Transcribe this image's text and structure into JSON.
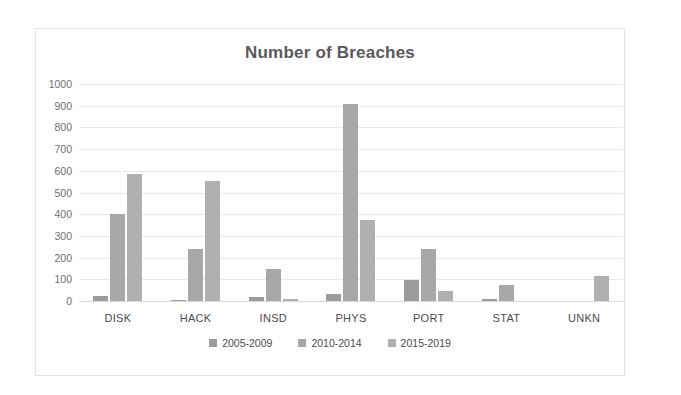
{
  "chart_data": {
    "type": "bar",
    "title": "Number of Breaches",
    "xlabel": "",
    "ylabel": "",
    "ylim": [
      0,
      1000
    ],
    "ytick_step": 100,
    "yticks": [
      "1000",
      "900",
      "800",
      "700",
      "600",
      "500",
      "400",
      "300",
      "200",
      "100",
      "0"
    ],
    "grid": true,
    "legend_position": "bottom",
    "categories": [
      "DISK",
      "HACK",
      "INSD",
      "PHYS",
      "PORT",
      "STAT",
      "UNKN"
    ],
    "series": [
      {
        "name": "2005-2009",
        "color": "#9c9c9e",
        "values": [
          25,
          5,
          20,
          33,
          97,
          10,
          0
        ]
      },
      {
        "name": "2010-2014",
        "color": "#a8a8aa",
        "values": [
          400,
          240,
          148,
          910,
          240,
          72,
          0
        ]
      },
      {
        "name": "2015-2019",
        "color": "#b0b0b2",
        "values": [
          585,
          555,
          8,
          375,
          48,
          0,
          115
        ]
      }
    ]
  },
  "colors": {
    "title": "#59595b",
    "gridline": "#e9e9ea",
    "axis": "#d9d9da",
    "frame_border": "#e3e3e3",
    "tick_text": "#6d6e70",
    "label_text": "#4b4b4d",
    "background": "#ffffff"
  }
}
